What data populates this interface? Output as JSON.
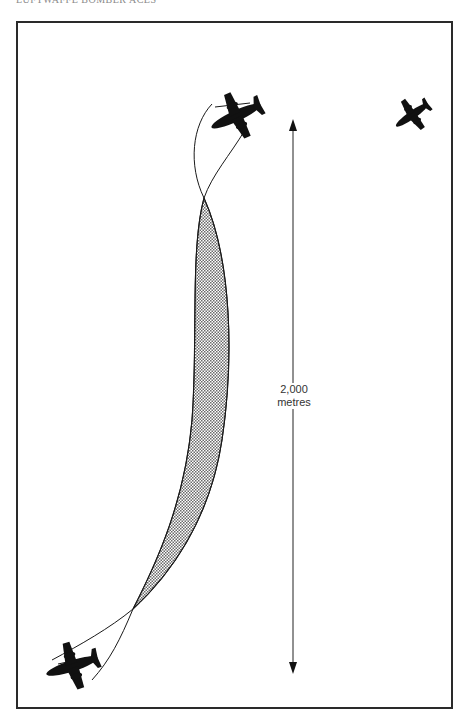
{
  "header": {
    "title": "LUFTWAFFE BOMBER ACES"
  },
  "diagram": {
    "distance_value": "2,000",
    "distance_unit": "metres",
    "colors": {
      "frame": "#2a2a2a",
      "line": "#1a1a1a",
      "aircraft": "#111111",
      "shading": "#9a9a9a"
    },
    "aircraft": [
      {
        "name": "attacking-aircraft-top",
        "icon": "bomber-silhouette-icon"
      },
      {
        "name": "target-aircraft-right",
        "icon": "bomber-silhouette-icon"
      },
      {
        "name": "attacking-aircraft-bottom",
        "icon": "bomber-silhouette-icon"
      }
    ]
  }
}
